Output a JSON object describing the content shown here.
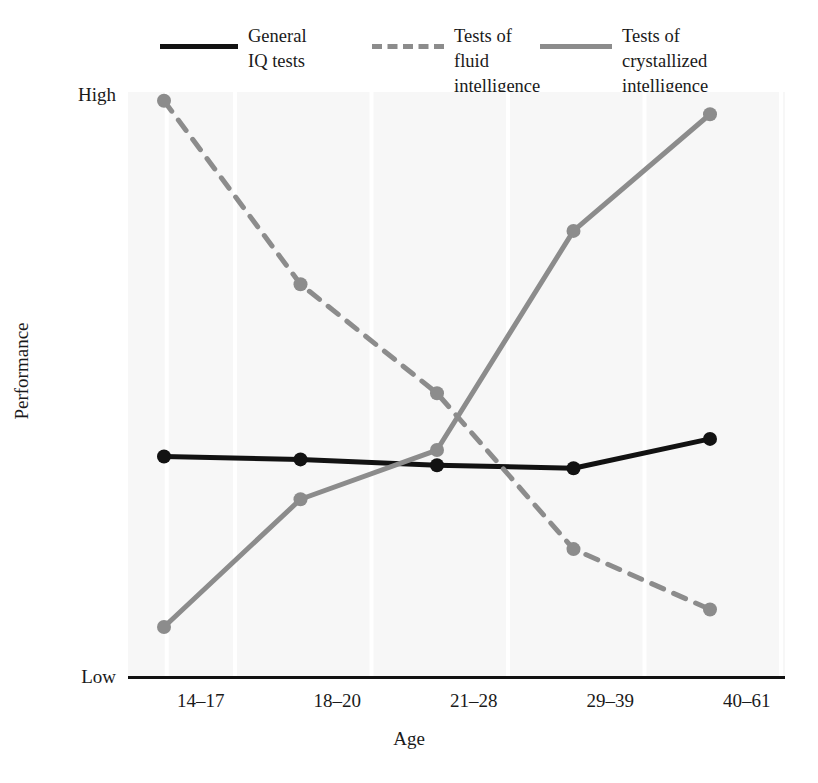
{
  "chart_data": {
    "type": "line",
    "title": "",
    "xlabel": "Age",
    "ylabel": "Performance",
    "categories": [
      "14–17",
      "18–20",
      "21–28",
      "29–39",
      "40–61"
    ],
    "ytick_labels": [
      "High",
      "Low"
    ],
    "ylim": [
      0,
      100
    ],
    "ylim_labels": [
      "Low",
      "High"
    ],
    "grid": true,
    "grid_orientation": "vertical",
    "legend_position": "top",
    "series": [
      {
        "name": "General IQ tests",
        "legend_label": "General\nIQ tests",
        "style": "solid",
        "color": "#121212",
        "marker": "circle",
        "values": [
          37.8,
          37.3,
          36.3,
          35.8,
          40.8
        ]
      },
      {
        "name": "Tests of fluid intelligence",
        "legend_label": "Tests of fluid\nintelligence",
        "style": "dashed",
        "color": "#8c8c8c",
        "marker": "circle",
        "values": [
          98.5,
          67.2,
          48.6,
          22.0,
          11.7
        ]
      },
      {
        "name": "Tests of crystallized intelligence",
        "legend_label": "Tests of crystallized\nintelligence",
        "style": "solid",
        "color": "#8c8c8c",
        "marker": "circle",
        "values": [
          8.7,
          30.5,
          38.9,
          76.3,
          96.2
        ]
      }
    ]
  },
  "colors": {
    "iq_line": "#121212",
    "fluid_line": "#8c8c8c",
    "crystallized_line": "#8c8c8c",
    "plot_background": "#f7f7f7",
    "gridline": "#ffffff",
    "axis": "#111111",
    "text": "#1a1a1a"
  },
  "axes": {
    "y_high_label": "High",
    "y_low_label": "Low",
    "y_title": "Performance",
    "x_title": "Age"
  },
  "legend": {
    "items": [
      {
        "key": "iq",
        "label": "General\nIQ tests",
        "style": "solid-black"
      },
      {
        "key": "fluid",
        "label": "Tests of fluid\nintelligence",
        "style": "dashed-gray"
      },
      {
        "key": "crystallized",
        "label": "Tests of crystallized\nintelligence",
        "style": "solid-gray"
      }
    ]
  },
  "caption": {
    "fragment": ""
  }
}
